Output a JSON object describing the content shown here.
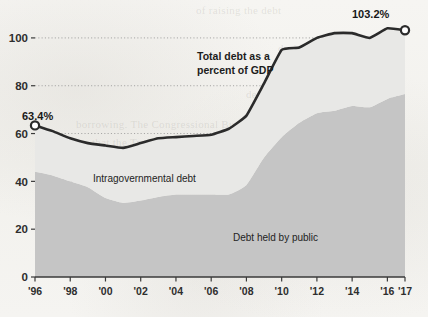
{
  "chart_data": {
    "type": "area",
    "title": "",
    "xlabel": "",
    "ylabel": "",
    "ylim": [
      0,
      110
    ],
    "xlim": [
      1996,
      2017
    ],
    "grid": true,
    "legend_position": "inline-annotations",
    "y_ticks": [
      "0",
      "20",
      "40",
      "60",
      "80",
      "100"
    ],
    "y_tick_values": [
      0,
      20,
      40,
      60,
      80,
      100
    ],
    "x_ticks": [
      "'96",
      "'98",
      "'00",
      "'02",
      "'04",
      "'06",
      "'08",
      "'10",
      "'12",
      "'14",
      "'16",
      "'17"
    ],
    "x_tick_values": [
      1996,
      1998,
      2000,
      2002,
      2004,
      2006,
      2008,
      2010,
      2012,
      2014,
      2016,
      2017
    ],
    "x": [
      1996,
      1997,
      1998,
      1999,
      2000,
      2001,
      2002,
      2003,
      2004,
      2005,
      2006,
      2007,
      2008,
      2009,
      2010,
      2011,
      2012,
      2013,
      2014,
      2015,
      2016,
      2017
    ],
    "series": [
      {
        "name": "Debt held by public",
        "kind": "area",
        "color": "#c5c5c5",
        "values": [
          44.0,
          42.5,
          40.0,
          37.5,
          33.0,
          31.0,
          32.0,
          33.5,
          34.5,
          34.5,
          34.5,
          34.5,
          38.5,
          50.0,
          58.5,
          64.5,
          68.5,
          69.5,
          71.5,
          71.0,
          74.5,
          76.5
        ]
      },
      {
        "name": "Intragovernmental debt",
        "kind": "area",
        "color": "#e8e8e6",
        "values": [
          19.4,
          18.5,
          18.0,
          18.5,
          22.0,
          23.0,
          24.0,
          24.5,
          24.0,
          24.5,
          25.0,
          27.5,
          29.0,
          31.0,
          36.5,
          31.5,
          31.5,
          32.5,
          30.5,
          29.0,
          29.5,
          26.7
        ]
      },
      {
        "name": "Total debt as a percent of GDP",
        "kind": "line",
        "color": "#2b2b2b",
        "values": [
          63.4,
          61.0,
          58.0,
          56.0,
          55.0,
          54.0,
          56.0,
          58.0,
          58.5,
          59.0,
          59.5,
          62.0,
          67.5,
          81.0,
          95.0,
          96.0,
          100.0,
          102.0,
          102.0,
          100.0,
          104.0,
          103.2
        ]
      }
    ],
    "annotations": [
      {
        "name": "start-value",
        "label": "63.4%",
        "x": 1996,
        "y": 63.4,
        "marker": "open-circle"
      },
      {
        "name": "end-value",
        "label": "103.2%",
        "x": 2017,
        "y": 103.2,
        "marker": "open-circle"
      }
    ],
    "inline_labels": [
      {
        "name": "total-debt-label",
        "line1": "Total debt as a",
        "line2": "percent of GDP",
        "bold": true
      },
      {
        "name": "intragovernmental-label",
        "text": "Intragovernmental debt",
        "bold": false
      },
      {
        "name": "public-debt-label",
        "text": "Debt held by public",
        "bold": false
      }
    ]
  },
  "colors": {
    "public_debt_fill": "#c5c5c5",
    "intragovernmental_fill": "#e8e8e6",
    "total_line": "#2b2b2b",
    "gridline": "#8f8f8f",
    "axis": "#3a3a3a",
    "page_background": "#f4f3f0",
    "tick_text": "#2e2e2e"
  },
  "ghost_text": {
    "note": "faint show-through text from reverse side of scanned page",
    "lines": [
      "of raising the debt",
      "during the fiscal",
      "bring the Sec",
      "dealing with the Debt Ceiling and",
      "borrowing. The Congressional Budget",
      "that the Treasury would be able to",
      "the debt limit with the use of",
      "Ceiling Limit Extraordinary",
      "measures. The Treasury has often",
      "used such measures in past"
    ]
  }
}
